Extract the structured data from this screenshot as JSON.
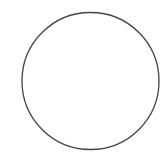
{
  "canvas": {
    "width": 167,
    "height": 161,
    "background": "#ffffff"
  },
  "shape": {
    "type": "circle",
    "cx": 90.5,
    "cy": 81,
    "r": 68.5,
    "stroke": "#444444",
    "stroke_width": 1.3,
    "fill": "#ffffff"
  }
}
